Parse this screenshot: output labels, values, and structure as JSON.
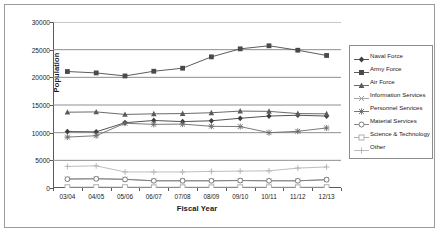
{
  "chart_data": {
    "type": "line",
    "title": "",
    "xlabel": "Fiscal Year",
    "ylabel": "Population",
    "categories": [
      "03/04",
      "04/05",
      "05/06",
      "06/07",
      "07/08",
      "08/09",
      "09/10",
      "10/11",
      "11/12",
      "12/13"
    ],
    "ylim": [
      0,
      30000
    ],
    "ytick_labels": [
      "0",
      "5000",
      "10000",
      "15000",
      "20000",
      "25000",
      "30000"
    ],
    "yticks": [
      0,
      5000,
      10000,
      15000,
      20000,
      25000,
      30000
    ],
    "grid": "horizontal",
    "legend_position": "right",
    "series": [
      {
        "name": "Naval Force",
        "marker": "diamond",
        "color": "#3f3f3f",
        "values": [
          10200,
          10150,
          11800,
          12200,
          12000,
          12150,
          12600,
          13000,
          13150,
          13000
        ]
      },
      {
        "name": "Army Force",
        "marker": "square",
        "color": "#4a4a4a",
        "values": [
          21050,
          20800,
          20250,
          21100,
          21650,
          23700,
          25150,
          25700,
          24900,
          23950
        ]
      },
      {
        "name": "Air Force",
        "marker": "triangle",
        "color": "#5a5a5a",
        "values": [
          13700,
          13750,
          13300,
          13400,
          13450,
          13600,
          13900,
          13850,
          13450,
          13400
        ]
      },
      {
        "name": "Information Services",
        "marker": "cross-x",
        "color": "#9c9c9c",
        "values": [
          1650,
          1700,
          1600,
          1300,
          1300,
          1300,
          1350,
          1300,
          1300,
          1500
        ]
      },
      {
        "name": "Personnel Services",
        "marker": "star",
        "color": "#6b6b6b",
        "values": [
          9200,
          9450,
          11700,
          11500,
          11550,
          11150,
          11100,
          10000,
          10250,
          10850
        ]
      },
      {
        "name": "Material Services",
        "marker": "circle",
        "color": "#7a7a7a",
        "values": [
          1600,
          1650,
          1550,
          1300,
          1300,
          1300,
          1350,
          1300,
          1300,
          1500
        ]
      },
      {
        "name": "Science & Technology",
        "marker": "open-square",
        "color": "#a8a8a8",
        "values": [
          150,
          160,
          150,
          140,
          140,
          140,
          150,
          140,
          140,
          150
        ]
      },
      {
        "name": "Other",
        "marker": "plus",
        "color": "#b5b5b5",
        "values": [
          3900,
          4000,
          2900,
          2900,
          2900,
          3000,
          3050,
          3100,
          3600,
          3800
        ]
      }
    ]
  }
}
